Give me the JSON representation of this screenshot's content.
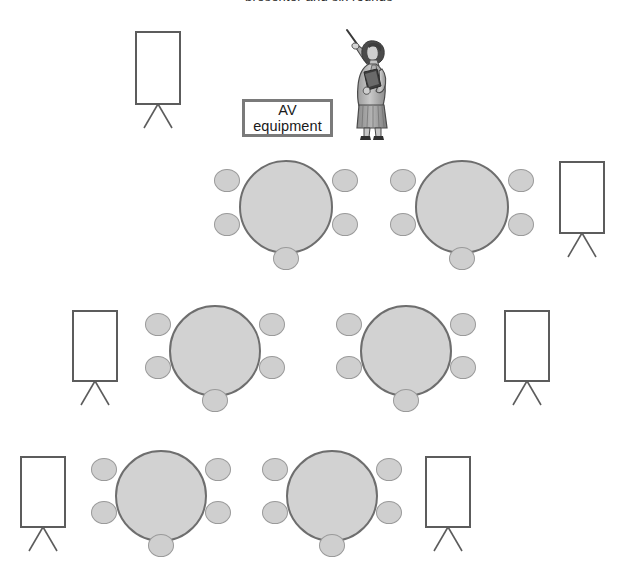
{
  "diagram": {
    "caption_remnant": "presenter and six rounds",
    "background_color": "#ffffff"
  },
  "palette": {
    "table_fill": "#d2d2d2",
    "table_stroke": "#6e6e6e",
    "chair_fill": "#cfcfcf",
    "chair_stroke": "#9a9a9a",
    "flipchart_stroke": "#5c5c5c",
    "av_box_stroke": "#7a7a7a",
    "text_color": "#1a1a1a"
  },
  "av_equipment": {
    "line1": "AV",
    "line2": "equipment",
    "label": "AV equipment"
  },
  "presenter": {
    "label": "presenter",
    "description": "Woman standing, raising a pointer in her right hand and holding a folder"
  },
  "flipcharts": [
    {
      "id": "flipchart-top-left",
      "label": "Flipchart"
    },
    {
      "id": "flipchart-right-upper",
      "label": "Flipchart"
    },
    {
      "id": "flipchart-mid-left",
      "label": "Flipchart"
    },
    {
      "id": "flipchart-mid-right",
      "label": "Flipchart"
    },
    {
      "id": "flipchart-bottom-left",
      "label": "Flipchart"
    },
    {
      "id": "flipchart-bottom-right",
      "label": "Flipchart"
    }
  ],
  "tables": [
    {
      "id": "table-1",
      "row": 1,
      "seats": 5,
      "label": "Round table 1"
    },
    {
      "id": "table-2",
      "row": 1,
      "seats": 5,
      "label": "Round table 2"
    },
    {
      "id": "table-3",
      "row": 2,
      "seats": 5,
      "label": "Round table 3"
    },
    {
      "id": "table-4",
      "row": 2,
      "seats": 5,
      "label": "Round table 4"
    },
    {
      "id": "table-5",
      "row": 3,
      "seats": 5,
      "label": "Round table 5"
    },
    {
      "id": "table-6",
      "row": 3,
      "seats": 5,
      "label": "Round table 6"
    }
  ],
  "counts": {
    "tables": 6,
    "seats_per_table": 5,
    "total_seats": 30,
    "flipcharts": 6
  }
}
